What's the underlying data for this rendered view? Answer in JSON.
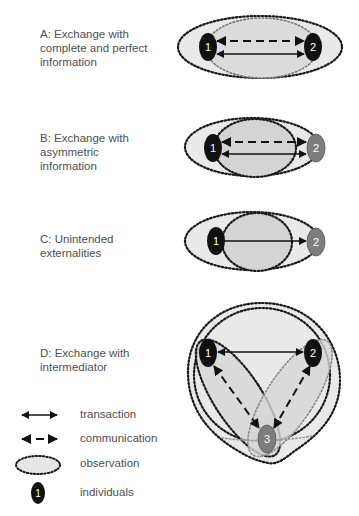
{
  "panels": [
    {
      "id": "A",
      "title_lines": [
        "A: Exchange with",
        "complete and perfect",
        "information"
      ]
    },
    {
      "id": "B",
      "title_lines": [
        "B: Exchange with",
        "asymmetric",
        "information"
      ]
    },
    {
      "id": "C",
      "title_lines": [
        "C: Unintended",
        "externalities"
      ]
    },
    {
      "id": "D",
      "title_lines": [
        "D: Exchange with",
        "intermediator"
      ]
    }
  ],
  "nodes": {
    "one": "1",
    "two": "2",
    "three": "3"
  },
  "legend": {
    "transaction": "transaction",
    "communication": "communication",
    "observation": "observation",
    "individuals": "individuals",
    "sample_node": "1"
  },
  "colors": {
    "node_dark": "#111111",
    "node_gray": "#808080",
    "fill_light": "#e6e6e6",
    "fill_mid": "#d6d6d6",
    "dots": "#1a1a1a",
    "text": "#4f4f4f"
  }
}
